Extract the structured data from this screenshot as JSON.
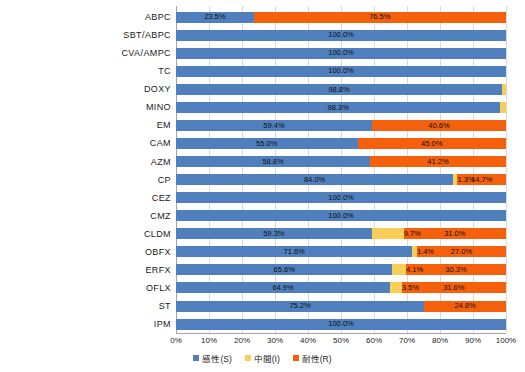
{
  "chart_data": {
    "type": "bar",
    "subtype": "horizontal-100-percent-stacked",
    "title": "",
    "xlabel": "",
    "ylabel": "",
    "xlim": [
      0,
      100
    ],
    "xticks": [
      "0%",
      "10%",
      "20%",
      "30%",
      "40%",
      "50%",
      "60%",
      "70%",
      "80%",
      "90%",
      "100%"
    ],
    "xtick_values": [
      0,
      10,
      20,
      30,
      40,
      50,
      60,
      70,
      80,
      90,
      100
    ],
    "grid": true,
    "grid_axis": "x",
    "legend_position": "bottom-center",
    "categories": [
      "ABPC",
      "SBT/ABPC",
      "CVA/AMPC",
      "TC",
      "DOXY",
      "MINO",
      "EM",
      "CAM",
      "AZM",
      "CP",
      "CEZ",
      "CMZ",
      "CLDM",
      "OBFX",
      "ERFX",
      "OFLX",
      "ST",
      "IPM"
    ],
    "series": [
      {
        "name": "感性(S)",
        "key": "S",
        "color": "#4f7fbd",
        "values": [
          23.5,
          100.0,
          100.0,
          100.0,
          98.8,
          98.3,
          59.4,
          55.0,
          58.8,
          84.0,
          100.0,
          100.0,
          59.3,
          71.6,
          65.6,
          64.9,
          75.2,
          100.0
        ]
      },
      {
        "name": "中間(I)",
        "key": "I",
        "color": "#f9ce56",
        "values": [
          0,
          0,
          0,
          0,
          1.2,
          1.7,
          0,
          0,
          0,
          1.3,
          0,
          0,
          9.7,
          1.4,
          4.1,
          3.5,
          0,
          0
        ]
      },
      {
        "name": "耐性(R)",
        "key": "R",
        "color": "#f4600c",
        "values": [
          76.5,
          0,
          0,
          0,
          0,
          0,
          40.6,
          45.0,
          41.2,
          14.7,
          0,
          0,
          31.0,
          27.0,
          30.3,
          31.6,
          24.8,
          0
        ]
      }
    ],
    "rows": [
      {
        "label": "ABPC",
        "S": 23.5,
        "I": 0,
        "R": 76.5,
        "S_text": "23.5%",
        "I_text": "",
        "R_text": "76.5%"
      },
      {
        "label": "SBT/ABPC",
        "S": 100.0,
        "I": 0,
        "R": 0,
        "S_text": "100.0%",
        "I_text": "",
        "R_text": ""
      },
      {
        "label": "CVA/AMPC",
        "S": 100.0,
        "I": 0,
        "R": 0,
        "S_text": "100.0%",
        "I_text": "",
        "R_text": ""
      },
      {
        "label": "TC",
        "S": 100.0,
        "I": 0,
        "R": 0,
        "S_text": "100.0%",
        "I_text": "",
        "R_text": ""
      },
      {
        "label": "DOXY",
        "S": 98.8,
        "I": 1.2,
        "R": 0,
        "S_text": "98.8%",
        "I_text": "1.2%",
        "R_text": ""
      },
      {
        "label": "MINO",
        "S": 98.3,
        "I": 1.7,
        "R": 0,
        "S_text": "98.3%",
        "I_text": "1.7%",
        "R_text": ""
      },
      {
        "label": "EM",
        "S": 59.4,
        "I": 0,
        "R": 40.6,
        "S_text": "59.4%",
        "I_text": "",
        "R_text": "40.6%"
      },
      {
        "label": "CAM",
        "S": 55.0,
        "I": 0,
        "R": 45.0,
        "S_text": "55.0%",
        "I_text": "",
        "R_text": "45.0%"
      },
      {
        "label": "AZM",
        "S": 58.8,
        "I": 0,
        "R": 41.2,
        "S_text": "58.8%",
        "I_text": "",
        "R_text": "41.2%"
      },
      {
        "label": "CP",
        "S": 84.0,
        "I": 1.3,
        "R": 14.7,
        "S_text": "84.0%",
        "I_text": "1.3%",
        "R_text": "14.7%"
      },
      {
        "label": "CEZ",
        "S": 100.0,
        "I": 0,
        "R": 0,
        "S_text": "100.0%",
        "I_text": "",
        "R_text": ""
      },
      {
        "label": "CMZ",
        "S": 100.0,
        "I": 0,
        "R": 0,
        "S_text": "100.0%",
        "I_text": "",
        "R_text": ""
      },
      {
        "label": "CLDM",
        "S": 59.3,
        "I": 9.7,
        "R": 31.0,
        "S_text": "59.3%",
        "I_text": "9.7%",
        "R_text": "31.0%"
      },
      {
        "label": "OBFX",
        "S": 71.6,
        "I": 1.4,
        "R": 27.0,
        "S_text": "71.6%",
        "I_text": "1.4%",
        "R_text": "27.0%"
      },
      {
        "label": "ERFX",
        "S": 65.6,
        "I": 4.1,
        "R": 30.3,
        "S_text": "65.6%",
        "I_text": "4.1%",
        "R_text": "30.3%"
      },
      {
        "label": "OFLX",
        "S": 64.9,
        "I": 3.5,
        "R": 31.6,
        "S_text": "64.9%",
        "I_text": "3.5%",
        "R_text": "31.6%"
      },
      {
        "label": "ST",
        "S": 75.2,
        "I": 0,
        "R": 24.8,
        "S_text": "75.2%",
        "I_text": "",
        "R_text": "24.8%"
      },
      {
        "label": "IPM",
        "S": 100.0,
        "I": 0,
        "R": 0,
        "S_text": "100.0%",
        "I_text": "",
        "R_text": ""
      }
    ]
  },
  "legend": {
    "items": [
      {
        "label": "感性(S)",
        "color": "#4f7fbd"
      },
      {
        "label": "中間(I)",
        "color": "#f9ce56"
      },
      {
        "label": "耐性(R)",
        "color": "#f4600c"
      }
    ]
  },
  "colors": {
    "susceptible": "#4f7fbd",
    "intermediate": "#f9ce56",
    "resistant": "#f4600c",
    "axis": "#a6a6a6",
    "gridline": "#d9d9d9",
    "background": "#ffffff"
  }
}
